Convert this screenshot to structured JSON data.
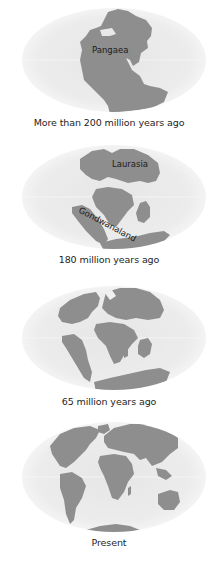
{
  "figure": {
    "colors": {
      "land": "#8e8e8e",
      "ocean_center": "#e9e9e9",
      "ocean_edge": "#f7f7f7",
      "text": "#1e1e1e",
      "background": "#ffffff"
    },
    "panels": [
      {
        "caption": "More than 200 million years ago",
        "labels": [
          {
            "text": "Pangaea"
          }
        ]
      },
      {
        "caption": "180 million years ago",
        "labels": [
          {
            "text": "Laurasia"
          },
          {
            "text": "Gondwanaland"
          }
        ]
      },
      {
        "caption": "65 million years ago",
        "labels": []
      },
      {
        "caption": "Present",
        "labels": []
      }
    ]
  }
}
